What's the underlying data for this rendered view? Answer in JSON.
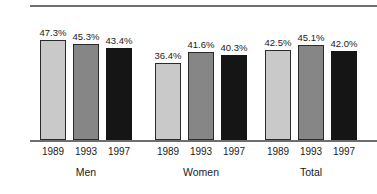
{
  "chart_data": {
    "type": "bar",
    "title": "",
    "subtitle": "",
    "xlabel": "",
    "ylabel": "",
    "ylim": [
      0,
      55
    ],
    "grid": false,
    "legend_position": "none",
    "categories": [
      "Men",
      "Women",
      "Total"
    ],
    "series": [
      {
        "name": "1989",
        "values": [
          47.3,
          36.4,
          42.5
        ],
        "style": "light",
        "color": "#c9c9c9"
      },
      {
        "name": "1993",
        "values": [
          45.3,
          41.6,
          45.1
        ],
        "style": "medium",
        "color": "#868686"
      },
      {
        "name": "1997",
        "values": [
          43.4,
          40.3,
          42.0
        ],
        "style": "dark",
        "color": "#151515"
      }
    ],
    "value_labels": [
      [
        "47.3%",
        "45.3%",
        "43.4%"
      ],
      [
        "36.4%",
        "41.6%",
        "40.3%"
      ],
      [
        "42.5%",
        "45.1%",
        "42.0%"
      ]
    ],
    "tick_labels": [
      [
        "1989",
        "1993",
        "1997"
      ],
      [
        "1989",
        "1993",
        "1997"
      ],
      [
        "1989",
        "1993",
        "1997"
      ]
    ],
    "group_labels": [
      "Men",
      "Women",
      "Total"
    ],
    "axis_color": "#6e6e6e",
    "text_color": "#1b1b1b",
    "bar_border_color": "#2b2b2b"
  },
  "groups": [
    {
      "label": "Men",
      "bars": [
        {
          "year": "1989",
          "value": 47.3,
          "value_label": "47.3%",
          "style": "light"
        },
        {
          "year": "1993",
          "value": 45.3,
          "value_label": "45.3%",
          "style": "medium"
        },
        {
          "year": "1997",
          "value": 43.4,
          "value_label": "43.4%",
          "style": "dark"
        }
      ]
    },
    {
      "label": "Women",
      "bars": [
        {
          "year": "1989",
          "value": 36.4,
          "value_label": "36.4%",
          "style": "light"
        },
        {
          "year": "1993",
          "value": 41.6,
          "value_label": "41.6%",
          "style": "medium"
        },
        {
          "year": "1997",
          "value": 40.3,
          "value_label": "40.3%",
          "style": "dark"
        }
      ]
    },
    {
      "label": "Total",
      "bars": [
        {
          "year": "1989",
          "value": 42.5,
          "value_label": "42.5%",
          "style": "light"
        },
        {
          "year": "1993",
          "value": 45.1,
          "value_label": "45.1%",
          "style": "medium"
        },
        {
          "year": "1997",
          "value": 42.0,
          "value_label": "42.0%",
          "style": "dark"
        }
      ]
    }
  ],
  "layout": {
    "group_x": [
      40,
      155,
      265
    ],
    "bar_pitch": 33,
    "bar_width": 26,
    "baseline_y": 140,
    "value_scale_px_per_unit": 2.116,
    "top_rule_y": 5
  }
}
